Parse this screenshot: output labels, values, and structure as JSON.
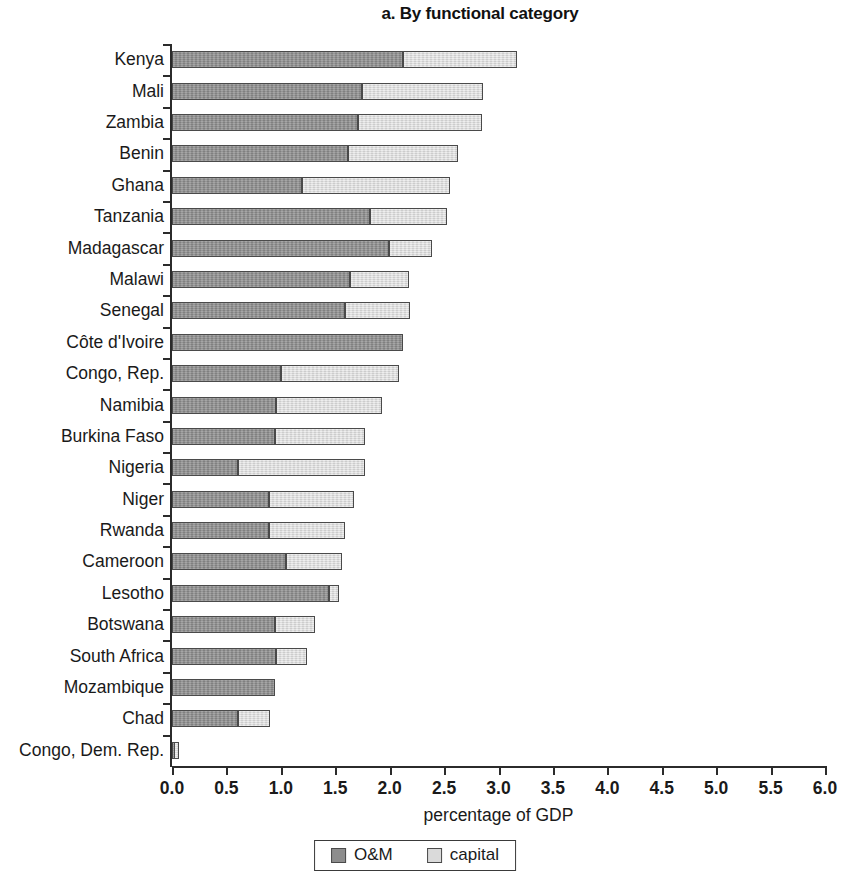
{
  "chart_data": {
    "type": "bar",
    "orientation": "horizontal",
    "stacked": true,
    "title": "a. By functional category",
    "xlabel": "percentage of GDP",
    "ylabel": "",
    "xlim": [
      0.0,
      6.0
    ],
    "xticks": [
      "0.0",
      "0.5",
      "1.0",
      "1.5",
      "2.0",
      "2.5",
      "3.0",
      "3.5",
      "4.0",
      "4.5",
      "5.0",
      "5.5",
      "6.0"
    ],
    "xtick_values": [
      0.0,
      0.5,
      1.0,
      1.5,
      2.0,
      2.5,
      3.0,
      3.5,
      4.0,
      4.5,
      5.0,
      5.5,
      6.0
    ],
    "grid": false,
    "legend_position": "bottom",
    "categories": [
      "Kenya",
      "Mali",
      "Zambia",
      "Benin",
      "Ghana",
      "Tanzania",
      "Madagascar",
      "Malawi",
      "Senegal",
      "Côte d'Ivoire",
      "Congo, Rep.",
      "Namibia",
      "Burkina Faso",
      "Nigeria",
      "Niger",
      "Rwanda",
      "Cameroon",
      "Lesotho",
      "Botswana",
      "South Africa",
      "Mozambique",
      "Chad",
      "Congo, Dem. Rep."
    ],
    "series": [
      {
        "name": "O&M",
        "color": "#8d8d8d",
        "values": [
          2.12,
          1.75,
          1.71,
          1.62,
          1.19,
          1.82,
          1.99,
          1.64,
          1.59,
          2.12,
          1.0,
          0.96,
          0.95,
          0.61,
          0.89,
          0.89,
          1.05,
          1.44,
          0.95,
          0.96,
          0.95,
          0.61,
          0.02
        ]
      },
      {
        "name": "capital",
        "color": "#dadada",
        "values": [
          1.05,
          1.11,
          1.14,
          1.01,
          1.36,
          0.71,
          0.4,
          0.54,
          0.6,
          0.0,
          1.09,
          0.97,
          0.82,
          1.16,
          0.78,
          0.7,
          0.51,
          0.09,
          0.36,
          0.28,
          0.0,
          0.29,
          0.04
        ]
      }
    ],
    "totals": [
      3.17,
      2.86,
      2.85,
      2.63,
      2.55,
      2.53,
      2.39,
      2.18,
      2.19,
      2.12,
      2.09,
      1.93,
      1.77,
      1.77,
      1.67,
      1.59,
      1.56,
      1.53,
      1.31,
      1.24,
      0.95,
      0.9,
      0.06
    ]
  },
  "legend": {
    "items": [
      {
        "label": "O&M",
        "swatch": "om"
      },
      {
        "label": "capital",
        "swatch": "cap"
      }
    ]
  }
}
